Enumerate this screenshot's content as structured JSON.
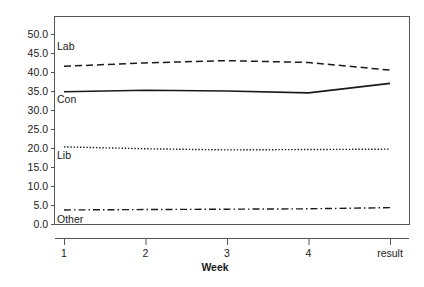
{
  "chart_data": {
    "type": "line",
    "title": "",
    "xlabel": "Week",
    "ylabel": "",
    "x": [
      "1",
      "2",
      "3",
      "4",
      "result"
    ],
    "categories": [
      "1",
      "2",
      "3",
      "4",
      "result"
    ],
    "ylim": [
      0.0,
      52.5
    ],
    "xlim": [
      0.5,
      5.6
    ],
    "grid": false,
    "legend_position": "inline-labels",
    "ytick_labels": [
      "0.0",
      "5.0",
      "10.0",
      "15.0",
      "20.0",
      "25.0",
      "30.0",
      "35.0",
      "40.0",
      "45.0",
      "50.0"
    ],
    "ytick_values": [
      0.0,
      5.0,
      10.0,
      15.0,
      20.0,
      25.0,
      30.0,
      35.0,
      40.0,
      45.0,
      50.0
    ],
    "xtick_labels": [
      "1",
      "2",
      "3",
      "4",
      "result"
    ],
    "series": [
      {
        "name": "Lab",
        "label": "Lab",
        "style": "dashed",
        "color": "#1a1a1a",
        "values": [
          41.5,
          42.4,
          43.0,
          42.5,
          40.5
        ]
      },
      {
        "name": "Con",
        "label": "Con",
        "style": "solid",
        "color": "#1a1a1a",
        "values": [
          34.8,
          35.2,
          35.0,
          34.5,
          37.0
        ]
      },
      {
        "name": "Lib",
        "label": "Lib",
        "style": "dotted",
        "color": "#1a1a1a",
        "values": [
          20.3,
          19.8,
          19.5,
          19.6,
          19.7
        ]
      },
      {
        "name": "Other",
        "label": "Other",
        "style": "dashdot",
        "color": "#1a1a1a",
        "values": [
          3.7,
          3.8,
          3.9,
          4.0,
          4.3
        ]
      }
    ],
    "annotations": [
      {
        "text": "Lab",
        "x_px": 57,
        "y_px": 50
      },
      {
        "text": "Con",
        "x_px": 57,
        "y_px": 103
      },
      {
        "text": "Lib",
        "x_px": 57,
        "y_px": 159
      },
      {
        "text": "Other",
        "x_px": 57,
        "y_px": 223
      }
    ]
  }
}
